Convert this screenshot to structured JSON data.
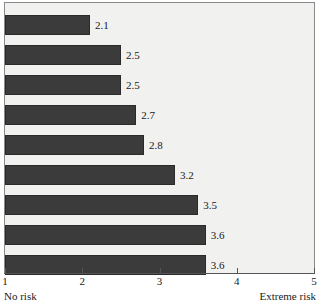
{
  "chart_data": {
    "type": "bar",
    "orientation": "horizontal",
    "title": "",
    "subtitle": "",
    "xlabel": "",
    "ylabel": "",
    "categories": [
      "",
      "",
      "",
      "",
      "",
      "",
      "",
      "",
      ""
    ],
    "values": [
      2.1,
      2.5,
      2.5,
      2.7,
      2.8,
      3.2,
      3.5,
      3.6,
      3.6
    ],
    "data_labels": [
      "2.1",
      "2.5",
      "2.5",
      "2.7",
      "2.8",
      "3.2",
      "3.5",
      "3.6",
      "3.6"
    ],
    "xlim": [
      1,
      5
    ],
    "xticks": [
      1,
      2,
      3,
      4,
      5
    ],
    "xtick_labels": [
      "1",
      "2",
      "3",
      "4",
      "5"
    ],
    "grid": false,
    "legend": null,
    "annotations": {
      "axis_min_label": "No risk",
      "axis_max_label": "Extreme risk"
    },
    "colors": {
      "bar_fill": "#3b3b3b",
      "bar_stroke": "#2a2a2a",
      "plot_background": "#f1f1ef",
      "plot_border": "#8a8a8a",
      "axis": "#555555",
      "text": "#1a1a1a"
    }
  }
}
